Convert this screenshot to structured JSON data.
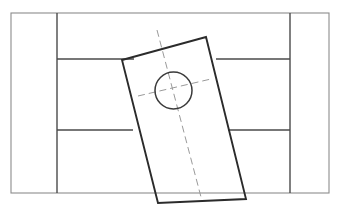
{
  "canvas": {
    "width": 343,
    "height": 207,
    "background": "#ffffff",
    "title": "Technical Part Drawing"
  },
  "style": {
    "frame_color": "#8c8c8c",
    "frame_width": 1.1,
    "grid_color": "#4a4a4a",
    "grid_width": 1.4,
    "part_color": "#2b2b2b",
    "part_width": 1.9,
    "hole_color": "#3a3a3a",
    "hole_width": 1.5,
    "centerline_color": "#9a9a9a",
    "centerline_width": 1.0,
    "centerline_dash": "7 4"
  },
  "frame": {
    "label": "outer-frame",
    "x": 11,
    "y": 13,
    "width": 318,
    "height": 180
  },
  "grid_lines": [
    {
      "name": "left-vertical-divider",
      "x1": 57,
      "y1": 13,
      "x2": 57,
      "y2": 193
    },
    {
      "name": "right-vertical-divider",
      "x1": 290,
      "y1": 13,
      "x2": 290,
      "y2": 193
    },
    {
      "name": "upper-left-horizontal",
      "x1": 57,
      "y1": 59,
      "x2": 134,
      "y2": 59
    },
    {
      "name": "upper-right-horizontal",
      "x1": 216,
      "y1": 59,
      "x2": 290,
      "y2": 59
    },
    {
      "name": "lower-left-horizontal",
      "x1": 57,
      "y1": 130,
      "x2": 133,
      "y2": 130
    },
    {
      "name": "lower-right-horizontal",
      "x1": 228,
      "y1": 130,
      "x2": 290,
      "y2": 130
    }
  ],
  "part": {
    "name": "rotated-rectangular-plate",
    "rotation_deg": 12,
    "corners": [
      {
        "label": "top-left",
        "x": 122,
        "y": 60
      },
      {
        "label": "top-right",
        "x": 206,
        "y": 37
      },
      {
        "label": "bottom-right",
        "x": 246,
        "y": 199
      },
      {
        "label": "bottom-left",
        "x": 158,
        "y": 203
      }
    ]
  },
  "hole": {
    "name": "circular-hole",
    "center_x": 173.5,
    "center_y": 90.5,
    "radius": 18.5
  },
  "centerlines": [
    {
      "name": "vertical-centerline",
      "x1": 157,
      "y1": 30,
      "x2": 201,
      "y2": 197
    },
    {
      "name": "horizontal-centerline",
      "x1": 138,
      "y1": 96,
      "x2": 211,
      "y2": 79
    }
  ]
}
